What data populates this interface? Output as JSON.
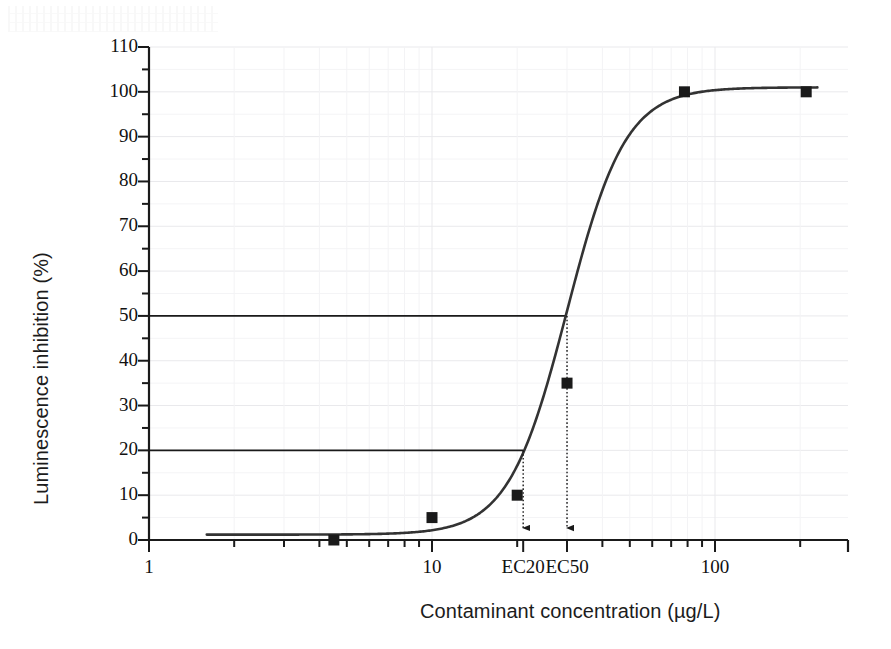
{
  "figure": {
    "kind": "scientific-figure",
    "background_color": "#ffffff",
    "ink_color": "#1a1a1a",
    "grid_color": "#e9e9ec"
  },
  "chart_data": {
    "type": "line",
    "title": "",
    "subtitle": "",
    "xlabel": "Contaminant concentration (µg/L)",
    "ylabel": "Luminescence inhibition (%)",
    "xscale": "log",
    "yscale": "linear",
    "xlim": [
      1,
      250
    ],
    "ylim": [
      0,
      110
    ],
    "grid": true,
    "legend": null,
    "legend_position": "none",
    "x_tick_labels": [
      "1",
      "10",
      "EC20",
      "EC50",
      "100"
    ],
    "x_tick_values": [
      1,
      10,
      21,
      30,
      100
    ],
    "y_tick_labels": [
      "0",
      "10",
      "20",
      "30",
      "40",
      "50",
      "60",
      "70",
      "80",
      "90",
      "100",
      "110"
    ],
    "y_tick_values": [
      0,
      10,
      20,
      30,
      40,
      50,
      60,
      70,
      80,
      90,
      100,
      110
    ],
    "y_minor_ticks": [
      5,
      15,
      25,
      35,
      45,
      55,
      65,
      75,
      85,
      95,
      105
    ],
    "series": [
      {
        "name": "Measured inhibition",
        "marker": "square",
        "marker_color": "#1a1a1a",
        "style": "points",
        "points": [
          {
            "x": 4.5,
            "y": 0
          },
          {
            "x": 10,
            "y": 5
          },
          {
            "x": 20,
            "y": 10
          },
          {
            "x": 30,
            "y": 35
          },
          {
            "x": 78,
            "y": 100
          },
          {
            "x": 210,
            "y": 100
          }
        ]
      },
      {
        "name": "Fitted dose-response curve",
        "style": "line",
        "line_color": "#333333",
        "line_width": 2.6,
        "model": "sigmoid",
        "ec50": 30,
        "hill_slope": 4.2,
        "top": 101,
        "bottom": 1.2,
        "x_range": [
          1.6,
          230
        ]
      }
    ],
    "annotations": [
      {
        "id": "ec20-hline",
        "type": "hline",
        "y": 20,
        "x_from": 1,
        "x_to": 21,
        "label": ""
      },
      {
        "id": "ec50-hline",
        "type": "hline",
        "y": 50,
        "x_from": 1,
        "x_to": 30,
        "label": ""
      },
      {
        "id": "ec20-arrow",
        "type": "arrow-down-dotted",
        "x": 21,
        "y_from": 20,
        "y_to": 0,
        "label": "EC20"
      },
      {
        "id": "ec50-arrow",
        "type": "arrow-down-dotted",
        "x": 30,
        "y_from": 50,
        "y_to": 0,
        "label": "EC50"
      }
    ]
  }
}
